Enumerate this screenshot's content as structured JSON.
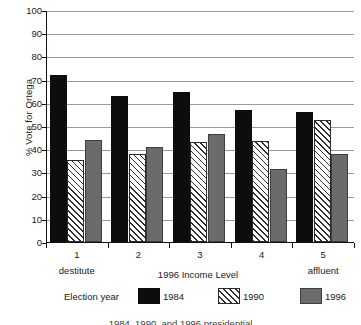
{
  "chart_data": {
    "type": "bar",
    "title": "",
    "xlabel": "1996 Income Level",
    "ylabel": "% Vote for Ortega",
    "categories": [
      "1",
      "2",
      "3",
      "4",
      "5"
    ],
    "category_end_labels": {
      "low": "destitute",
      "high": "affluent"
    },
    "series": [
      {
        "name": "1984",
        "values": [
          72,
          63,
          64.5,
          57,
          56
        ],
        "color": "#0d0d0d",
        "fill": "solid-black"
      },
      {
        "name": "1990",
        "values": [
          35.5,
          38,
          43,
          43.5,
          52.5
        ],
        "color": "#ffffff",
        "fill": "diagonal-hatch"
      },
      {
        "name": "1996",
        "values": [
          44,
          41,
          46.5,
          31.5,
          38
        ],
        "color": "#6b6b6b",
        "fill": "solid-gray"
      }
    ],
    "ylim": [
      0,
      100
    ],
    "ytick_values": [
      0,
      10,
      20,
      30,
      40,
      50,
      60,
      70,
      80,
      90,
      100
    ],
    "ytick_labels": [
      "0",
      "10",
      "20",
      "30",
      "40",
      "50",
      "60",
      "70",
      "80",
      "90",
      "100"
    ],
    "grid": true,
    "grid_axis": "y",
    "legend_title": "Election year",
    "legend_position": "bottom",
    "legend_entries": [
      "1984",
      "1990",
      "1996"
    ]
  },
  "axes": {
    "y_title": "% Vote for Ortega",
    "x_title": "1996 Income Level",
    "x_low_label": "destitute",
    "x_high_label": "affluent"
  },
  "legend": {
    "title": "Election year",
    "items": [
      {
        "label": "1984",
        "swatch": "solid-black-swatch"
      },
      {
        "label": "1990",
        "swatch": "hatched-swatch"
      },
      {
        "label": "1996",
        "swatch": "solid-gray-swatch"
      }
    ]
  },
  "caption": {
    "clipped_text": "1984, 1990, and 1996 presidential"
  },
  "colors": {
    "series_1984": "#0d0d0d",
    "series_1990": "#ffffff",
    "series_1996": "#6b6b6b",
    "gridline": "#9a9a9a",
    "axis": "#111111",
    "background": "#ffffff"
  }
}
